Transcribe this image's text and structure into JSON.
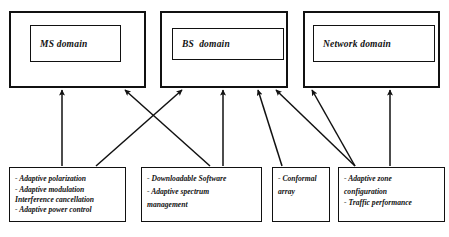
{
  "diagram": {
    "type": "block-diagram-with-arrows",
    "domains": [
      {
        "id": "ms",
        "label": "MS domain"
      },
      {
        "id": "bs",
        "label": "BS  domain"
      },
      {
        "id": "network",
        "label": "Network domain"
      }
    ],
    "features": [
      {
        "id": "ms-features",
        "lines": [
          "- Adaptive polarization",
          "- Adaptive modulation",
          " Interference cancellation",
          "- Adaptive power control"
        ]
      },
      {
        "id": "software-features",
        "lines": [
          "- Downloadable Software",
          "- Adaptive spectrum",
          "management"
        ]
      },
      {
        "id": "conformal-features",
        "lines": [
          "- Conformal",
          "array"
        ]
      },
      {
        "id": "zone-features",
        "lines": [
          "- Adaptive zone",
          "configuration",
          "- Traffic performance"
        ]
      }
    ],
    "connections": [
      {
        "from": "ms-features",
        "to": "ms",
        "style": "vertical"
      },
      {
        "from": "ms-features",
        "to": "bs",
        "style": "diagonal-right"
      },
      {
        "from": "software-features",
        "to": "ms",
        "style": "diagonal-left"
      },
      {
        "from": "software-features",
        "to": "bs",
        "style": "vertical"
      },
      {
        "from": "conformal-features",
        "to": "bs",
        "style": "diagonal-right"
      },
      {
        "from": "zone-features",
        "to": "bs",
        "style": "diagonal-left"
      },
      {
        "from": "zone-features",
        "to": "network",
        "style": "diagonal-left-short"
      },
      {
        "from": "zone-features",
        "to": "network",
        "style": "vertical"
      }
    ],
    "colors": {
      "stroke": "#111111",
      "background": "#ffffff",
      "text": "#111111"
    }
  }
}
